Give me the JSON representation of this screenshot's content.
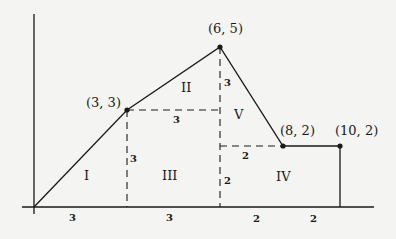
{
  "diagram": {
    "type": "piecewise-linear area decomposition",
    "points": [
      {
        "label": "(3, 3)",
        "x": 3,
        "y": 3
      },
      {
        "label": "(6, 5)",
        "x": 6,
        "y": 5
      },
      {
        "label": "(8, 2)",
        "x": 8,
        "y": 2
      },
      {
        "label": "(10, 2)",
        "x": 10,
        "y": 2
      }
    ],
    "regions": [
      {
        "label": "I"
      },
      {
        "label": "II"
      },
      {
        "label": "III"
      },
      {
        "label": "IV"
      },
      {
        "label": "V"
      }
    ],
    "dimensions": {
      "horizontal_3_33": "3",
      "vertical_3_x3": "3",
      "vertical_3_x6": "3",
      "vertical_2_x6": "2",
      "horizontal_2_82": "2",
      "axis_seg_1": "3",
      "axis_seg_2": "3",
      "axis_seg_3": "2",
      "axis_seg_4": "2"
    },
    "colors": {
      "line": "#1a1a1a",
      "background": "#f4f4f2"
    }
  }
}
